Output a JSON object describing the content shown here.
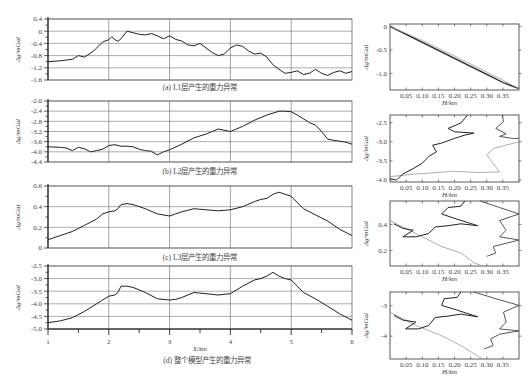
{
  "figure": {
    "caption": "(d) 整个模型产生的重力异常"
  },
  "chart_data": [
    {
      "id": "a",
      "type": "line",
      "title": "(a) L1层产生的重力异常",
      "xlabel": "X/km",
      "ylabel": "Δg/mGal",
      "xlim": [
        1,
        6
      ],
      "ylim": [
        -1.6,
        0.4
      ],
      "yticks": [
        "0.4",
        "0",
        "-0.4",
        "-0.8",
        "-1.2",
        "-1.6"
      ],
      "grid": true,
      "x": [
        1.0,
        1.2,
        1.4,
        1.5,
        1.6,
        1.75,
        1.9,
        2.0,
        2.05,
        2.1,
        2.15,
        2.2,
        2.3,
        2.4,
        2.5,
        2.6,
        2.7,
        2.8,
        2.9,
        3.0,
        3.1,
        3.2,
        3.3,
        3.4,
        3.5,
        3.6,
        3.7,
        3.8,
        3.9,
        4.0,
        4.1,
        4.2,
        4.3,
        4.4,
        4.5,
        4.6,
        4.7,
        4.8,
        4.9,
        5.0,
        5.1,
        5.2,
        5.3,
        5.4,
        5.5,
        5.6,
        5.7,
        5.8,
        5.9,
        6.0
      ],
      "values": [
        -1.0,
        -0.97,
        -0.92,
        -0.8,
        -0.85,
        -0.65,
        -0.35,
        -0.28,
        -0.18,
        -0.28,
        -0.33,
        -0.25,
        0.0,
        -0.05,
        -0.1,
        -0.12,
        -0.08,
        -0.15,
        -0.25,
        -0.15,
        -0.27,
        -0.32,
        -0.45,
        -0.48,
        -0.4,
        -0.55,
        -0.7,
        -0.8,
        -0.75,
        -0.55,
        -0.45,
        -0.5,
        -0.65,
        -0.75,
        -0.72,
        -0.85,
        -1.1,
        -1.25,
        -1.38,
        -1.35,
        -1.3,
        -1.42,
        -1.38,
        -1.25,
        -1.38,
        -1.45,
        -1.35,
        -1.3,
        -1.38,
        -1.32
      ]
    },
    {
      "id": "b",
      "type": "line",
      "title": "(b) L2层产生的重力异常",
      "xlabel": "X/km",
      "ylabel": "Δg/mGal",
      "xlim": [
        1,
        6
      ],
      "ylim": [
        -4.4,
        -2.0
      ],
      "yticks": [
        "-2.0",
        "-2.4",
        "-2.8",
        "-3.2",
        "-3.6",
        "-4.0",
        "-4.4"
      ],
      "grid": true,
      "x": [
        1.0,
        1.2,
        1.3,
        1.4,
        1.5,
        1.6,
        1.7,
        1.8,
        1.9,
        2.0,
        2.1,
        2.2,
        2.3,
        2.4,
        2.5,
        2.6,
        2.7,
        2.8,
        2.9,
        3.0,
        3.2,
        3.4,
        3.6,
        3.8,
        4.0,
        4.2,
        4.4,
        4.6,
        4.8,
        4.9,
        5.0,
        5.1,
        5.2,
        5.3,
        5.4,
        5.5,
        5.6,
        5.7,
        5.8,
        5.9,
        6.0
      ],
      "values": [
        -3.8,
        -3.82,
        -3.85,
        -3.95,
        -3.82,
        -3.88,
        -4.0,
        -3.95,
        -3.9,
        -3.75,
        -3.72,
        -3.78,
        -3.78,
        -3.8,
        -3.9,
        -3.95,
        -3.98,
        -4.12,
        -4.0,
        -3.92,
        -3.7,
        -3.45,
        -3.3,
        -3.1,
        -3.2,
        -3.0,
        -2.75,
        -2.55,
        -2.4,
        -2.4,
        -2.42,
        -2.55,
        -2.7,
        -2.85,
        -2.95,
        -3.2,
        -3.5,
        -3.55,
        -3.58,
        -3.62,
        -3.7
      ]
    },
    {
      "id": "c",
      "type": "line",
      "title": "(c) L3层产生的重力异常",
      "xlabel": "X/km",
      "ylabel": "Δg/mGal",
      "xlim": [
        1,
        6
      ],
      "ylim": [
        0,
        0.6
      ],
      "yticks": [
        "0.6",
        "0.4",
        "0.2",
        "0"
      ],
      "grid": true,
      "x": [
        1.0,
        1.2,
        1.4,
        1.6,
        1.8,
        1.9,
        2.0,
        2.1,
        2.15,
        2.2,
        2.3,
        2.4,
        2.6,
        2.8,
        3.0,
        3.1,
        3.2,
        3.4,
        3.6,
        3.8,
        4.0,
        4.2,
        4.4,
        4.5,
        4.6,
        4.7,
        4.8,
        4.9,
        5.0,
        5.1,
        5.2,
        5.4,
        5.6,
        5.8,
        6.0
      ],
      "values": [
        0.08,
        0.12,
        0.16,
        0.22,
        0.28,
        0.33,
        0.35,
        0.36,
        0.38,
        0.42,
        0.43,
        0.42,
        0.38,
        0.33,
        0.31,
        0.33,
        0.35,
        0.38,
        0.37,
        0.36,
        0.37,
        0.4,
        0.45,
        0.47,
        0.48,
        0.52,
        0.54,
        0.52,
        0.5,
        0.44,
        0.38,
        0.32,
        0.26,
        0.18,
        0.12
      ]
    },
    {
      "id": "d",
      "type": "line",
      "title": "(d) 整个模型产生的重力异常",
      "xlabel": "X/km",
      "ylabel": "Δg/mGal",
      "xlim": [
        1,
        6
      ],
      "ylim": [
        -5.0,
        -2.5
      ],
      "yticks": [
        "-2.5",
        "-3.0",
        "-3.5",
        "-4.0",
        "-4.5",
        "-5.0"
      ],
      "xticks": [
        "1",
        "2",
        "3",
        "4",
        "5",
        "6"
      ],
      "grid": true,
      "x": [
        1.0,
        1.2,
        1.4,
        1.6,
        1.8,
        1.9,
        2.0,
        2.1,
        2.15,
        2.2,
        2.3,
        2.4,
        2.6,
        2.8,
        3.0,
        3.1,
        3.2,
        3.4,
        3.6,
        3.8,
        4.0,
        4.2,
        4.4,
        4.5,
        4.6,
        4.7,
        4.8,
        4.9,
        5.0,
        5.1,
        5.2,
        5.4,
        5.6,
        5.8,
        6.0
      ],
      "values": [
        -4.75,
        -4.68,
        -4.55,
        -4.3,
        -4.0,
        -3.85,
        -3.7,
        -3.65,
        -3.55,
        -3.3,
        -3.3,
        -3.35,
        -3.55,
        -3.8,
        -3.85,
        -3.82,
        -3.75,
        -3.55,
        -3.6,
        -3.65,
        -3.6,
        -3.3,
        -3.05,
        -3.0,
        -2.9,
        -2.75,
        -2.9,
        -3.0,
        -3.05,
        -3.3,
        -3.55,
        -3.8,
        -4.1,
        -4.4,
        -4.65
      ]
    },
    {
      "id": "a-right",
      "type": "line",
      "xlabel": "H/km",
      "ylabel": "Δg/mGal",
      "xlim": [
        0,
        0.4
      ],
      "ylim": [
        -1.35,
        0.05
      ],
      "xticks": [
        "0.05",
        "0.10",
        "0.15",
        "0.20",
        "0.25",
        "0.30",
        "0.35"
      ],
      "yticks": [
        "0",
        "-0.5",
        "-1.0"
      ],
      "series": [
        {
          "name": "dark",
          "x": [
            0.0,
            0.05,
            0.1,
            0.15,
            0.2,
            0.25,
            0.3,
            0.35,
            0.4
          ],
          "values": [
            0.0,
            -0.17,
            -0.34,
            -0.51,
            -0.68,
            -0.85,
            -1.02,
            -1.19,
            -1.32
          ]
        },
        {
          "name": "light",
          "x": [
            0.0,
            0.1,
            0.2,
            0.3,
            0.4
          ],
          "values": [
            0.0,
            -0.3,
            -0.63,
            -0.97,
            -1.32
          ]
        }
      ]
    },
    {
      "id": "b-right",
      "type": "line",
      "xlabel": "H/km",
      "ylabel": "Δg/mGal",
      "xlim": [
        0,
        0.4
      ],
      "ylim": [
        -4.05,
        -2.3
      ],
      "xticks": [
        "0.05",
        "0.10",
        "0.15",
        "0.20",
        "0.25",
        "0.30",
        "0.35"
      ],
      "yticks": [
        "-2.5",
        "-3.0",
        "-3.5",
        "-4.0"
      ]
    },
    {
      "id": "c-right",
      "type": "line",
      "xlabel": "H/km",
      "ylabel": "Δg/mGal",
      "xlim": [
        0,
        0.4
      ],
      "ylim": [
        0.08,
        0.58
      ],
      "xticks": [
        "0.05",
        "0.10",
        "0.15",
        "0.20",
        "0.25",
        "0.30",
        "0.35"
      ],
      "yticks": [
        "0.4",
        "0.2"
      ]
    },
    {
      "id": "d-right",
      "type": "line",
      "xlabel": "H/km",
      "ylabel": "Δg/mGal",
      "xlim": [
        0,
        0.4
      ],
      "ylim": [
        -4.75,
        -2.55
      ],
      "xticks": [
        "0.05",
        "0.10",
        "0.15",
        "0.20",
        "0.25",
        "0.30",
        "0.35"
      ],
      "yticks": [
        "-3",
        "-4"
      ]
    }
  ]
}
